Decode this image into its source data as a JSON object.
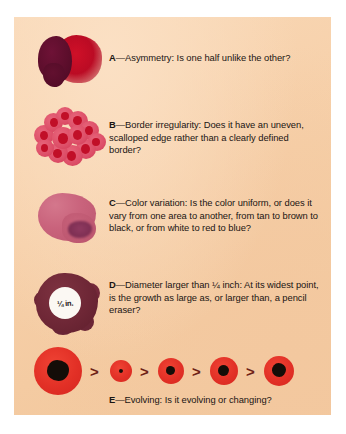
{
  "figure": {
    "background_color": "#f6cfa8",
    "frame_color": "#ffffff",
    "text_color": "#1a1513"
  },
  "rows": [
    {
      "letter": "A",
      "dash": "—",
      "text": "Asymmetry: Is one half unlike the other?",
      "full": "A—Asymmetry: Is one half unlike the other?",
      "art_name": "asymmetry-mole-illustration",
      "colors": {
        "dark_lobe": "#5d0e2c",
        "red_lobe": "#bb0b24"
      }
    },
    {
      "letter": "B",
      "dash": "—",
      "text": "Border irregularity: Does it have an uneven, scalloped edge rather than a clearly defined border?",
      "full": "B—Border irregularity: Does it have an uneven, scalloped edge rather than a clearly defined border?",
      "art_name": "border-irregularity-mole-illustration",
      "colors": {
        "bump": "#dd4f68",
        "spot": "#c10f28"
      }
    },
    {
      "letter": "C",
      "dash": "—",
      "text": "Color variation: Is the color uniform, or does it vary from one area to another, from tan to brown to black, or from white to red to blue?",
      "full": "C—Color variation: Is the color uniform, or does it vary from one area to another, from tan to brown to black, or from white to red to blue?",
      "art_name": "color-variation-mole-illustration",
      "colors": {
        "body": "#c9637c",
        "dark_patch": "#7c2e52"
      }
    },
    {
      "letter": "D",
      "dash": "—",
      "text": "Diameter larger than ¼ inch: At its widest point, is the growth as large as, or larger than, a pencil eraser?",
      "full": "D—Diameter larger than ¼ inch: At its widest point, is the growth as large as, or larger than, a pencil eraser?",
      "art_name": "diameter-mole-illustration",
      "measurement_label": "¼ in.",
      "colors": {
        "body": "#6e2736",
        "measure_circle": "#fbf8f3"
      }
    },
    {
      "letter": "E",
      "dash": "—",
      "text": "Evolving: Is it evolving or changing?",
      "full": "E—Evolving: Is it evolving or changing?",
      "art_name": "evolving-mole-sequence-illustration",
      "colors": {
        "ring": "#e23026",
        "core": "#140d08",
        "chevron": "#6e2115"
      }
    }
  ],
  "evolving_sequence": {
    "direction": "right-to-left growth progression",
    "separator": ">",
    "stages": [
      {
        "index": 1,
        "outer_diameter": 48,
        "core_diameter": 22,
        "label": "largest-lesion"
      },
      {
        "index": 2,
        "outer_diameter": 22,
        "core_diameter": 4,
        "label": "smallest-lesion"
      },
      {
        "index": 3,
        "outer_diameter": 26,
        "core_diameter": 9,
        "label": "stage-3-lesion"
      },
      {
        "index": 4,
        "outer_diameter": 28,
        "core_diameter": 11,
        "label": "stage-4-lesion"
      },
      {
        "index": 5,
        "outer_diameter": 30,
        "core_diameter": 14,
        "label": "stage-5-lesion"
      }
    ]
  }
}
